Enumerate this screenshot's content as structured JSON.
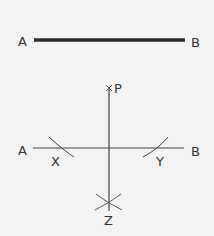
{
  "top": {
    "label_left": "A",
    "label_right": "B"
  },
  "bottom": {
    "label_left": "A",
    "label_right": "B",
    "label_p": "P",
    "label_x": "X",
    "label_y": "Y",
    "label_z": "Z"
  },
  "colors": {
    "background": "#f3f3f3",
    "line": "#333333",
    "thick_line": "#2b2b2b"
  }
}
